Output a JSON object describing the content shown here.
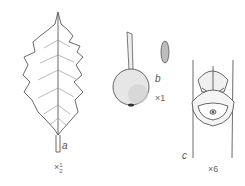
{
  "figure": {
    "panels": [
      {
        "id": "a",
        "subject": "holly leaf",
        "label": "a",
        "scale": "×½",
        "scale_prefix": "×",
        "scale_num": "1",
        "scale_den": "2"
      },
      {
        "id": "b",
        "subject": "berry with stalk and seed",
        "label": "b",
        "scale": "×1"
      },
      {
        "id": "c",
        "subject": "flower bud on stem",
        "label": "c",
        "scale": "×6"
      }
    ],
    "colors": {
      "ink": "#333333",
      "background": "#ffffff",
      "shade": "#bdbdbd"
    }
  }
}
